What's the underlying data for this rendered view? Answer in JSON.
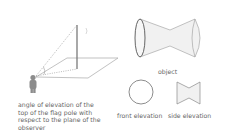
{
  "diagram": {
    "left_panel": {
      "caption_lines": [
        "angle of elevation of the",
        "top of the flag pole with",
        "respect to the plane of the",
        "observer"
      ],
      "elements": [
        "observer",
        "flag-pole",
        "ground-plane",
        "line-of-sight-to-top",
        "line-of-sight-to-base"
      ]
    },
    "right_panel": {
      "object_label": "object",
      "front_elevation_label": "front elevation",
      "side_elevation_label": "side elevation"
    },
    "colors": {
      "line": "#8a8a8a",
      "pole": "#777777",
      "observer": "#8c8c8c",
      "fill": "#f1f1f1",
      "text": "#666666"
    }
  }
}
